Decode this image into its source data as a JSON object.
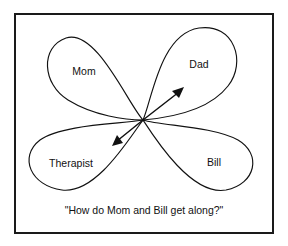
{
  "figure": {
    "type": "family-systems-petal-diagram",
    "background_color": "#ffffff",
    "ink_color": "#111111",
    "frame": {
      "stroke_color": "#1a1a1a",
      "x": 15,
      "y": 14,
      "width": 258,
      "height": 219
    },
    "center_point": {
      "x": 143,
      "y": 120
    },
    "petals": [
      {
        "id": "mom",
        "label": "Mom",
        "direction": "upper-left",
        "label_x": 84,
        "label_y": 72,
        "path": "M143,120 C128,104 96,28 66,38 C40,47 42,84 68,100 C94,116 126,120 143,120 Z"
      },
      {
        "id": "dad",
        "label": "Dad",
        "direction": "upper-right",
        "label_x": 199,
        "label_y": 65,
        "path": "M143,120 C152,100 160,34 199,28 C234,23 247,62 228,86 C208,112 166,118 143,120 Z"
      },
      {
        "id": "therapist",
        "label": "Therapist",
        "direction": "lower-left",
        "label_x": 71,
        "label_y": 164,
        "path": "M143,120 C124,124 62,124 40,140 C18,157 31,186 62,190 C96,194 128,140 143,120 Z"
      },
      {
        "id": "bill",
        "label": "Bill",
        "direction": "lower-right",
        "label_x": 214,
        "label_y": 163,
        "path": "M143,120 C162,126 212,126 238,140 C262,154 256,184 226,190 C192,196 156,140 143,120 Z"
      }
    ],
    "arrows": [
      {
        "id": "arrow-to-dad",
        "from_x": 143,
        "from_y": 120,
        "to_x": 182,
        "to_y": 90,
        "points_toward": "Dad"
      },
      {
        "id": "arrow-to-therapist",
        "from_x": 143,
        "from_y": 120,
        "to_x": 114,
        "to_y": 144,
        "points_toward": "Therapist"
      }
    ],
    "caption": {
      "text": "\"How do Mom and Bill get along?\"",
      "x": 144,
      "y": 211
    }
  }
}
